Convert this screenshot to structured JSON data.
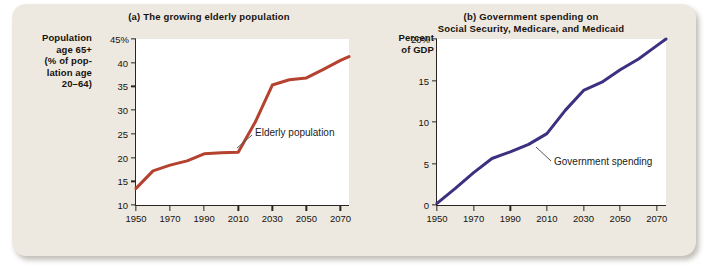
{
  "figure": {
    "background_color": "#eee9e0",
    "panels": [
      {
        "key": "a",
        "title": "(a) The growing elderly population",
        "y_axis_title": "Population\nage 65+\n(% of pop-\nlation age\n20–64)",
        "y_axis_title_lines": [
          "Population",
          "age 65+",
          "(% of pop-",
          "lation age",
          "20–64)"
        ],
        "annotation": "Elderly population",
        "line_color": "#b5412f"
      },
      {
        "key": "b",
        "title_lines": [
          "(b) Government spending on",
          "Social Security, Medicare, and Medicaid"
        ],
        "y_axis_title_lines": [
          "Percent",
          "of GDP"
        ],
        "annotation": "Government spending",
        "line_color": "#3b3180"
      }
    ]
  },
  "chart_data": [
    {
      "type": "line",
      "title": "(a) The growing elderly population",
      "xlabel": "",
      "ylabel": "Population age 65+ (% of population age 20–64)",
      "ylim": [
        10,
        45
      ],
      "xlim": [
        1950,
        2075
      ],
      "yticks": [
        10,
        15,
        20,
        25,
        30,
        35,
        40,
        45
      ],
      "ytick_labels": [
        "10",
        "15",
        "20",
        "25",
        "30",
        "35",
        "40",
        "45%"
      ],
      "xticks": [
        1950,
        1970,
        1990,
        2010,
        2030,
        2050,
        2070
      ],
      "xtick_labels": [
        "1950",
        "1970",
        "1990",
        "2010",
        "2030",
        "2050",
        "2070"
      ],
      "grid": false,
      "legend": "none",
      "series": [
        {
          "name": "Elderly population",
          "color": "#b5412f",
          "x": [
            1950,
            1960,
            1970,
            1980,
            1990,
            2000,
            2010,
            2020,
            2030,
            2040,
            2050,
            2060,
            2070,
            2075
          ],
          "values": [
            13.5,
            17.2,
            18.4,
            19.3,
            20.8,
            21.0,
            21.1,
            27.5,
            35.3,
            36.4,
            36.8,
            38.6,
            40.5,
            41.3
          ]
        }
      ],
      "annotations": [
        {
          "text": "Elderly population",
          "x": 2012,
          "y": 21.0
        }
      ]
    },
    {
      "type": "line",
      "title": "(b) Government spending on Social Security, Medicare, and Medicaid",
      "xlabel": "",
      "ylabel": "Percent of GDP",
      "ylim": [
        0,
        20
      ],
      "xlim": [
        1950,
        2075
      ],
      "yticks": [
        0,
        5,
        10,
        15,
        20
      ],
      "ytick_labels": [
        "0",
        "5",
        "10",
        "15",
        "20%"
      ],
      "xticks": [
        1950,
        1970,
        1990,
        2010,
        2030,
        2050,
        2070
      ],
      "xtick_labels": [
        "1950",
        "1970",
        "1990",
        "2010",
        "2030",
        "2050",
        "2070"
      ],
      "grid": false,
      "legend": "none",
      "series": [
        {
          "name": "Government spending",
          "color": "#3b3180",
          "x": [
            1950,
            1960,
            1970,
            1980,
            1985,
            1990,
            2000,
            2010,
            2020,
            2030,
            2040,
            2050,
            2060,
            2070,
            2075
          ],
          "values": [
            0.2,
            2.0,
            3.9,
            5.6,
            6.0,
            6.4,
            7.3,
            8.6,
            11.4,
            13.8,
            14.8,
            16.3,
            17.6,
            19.2,
            20.0
          ]
        }
      ],
      "annotations": [
        {
          "text": "Government spending",
          "x": 2012,
          "y": 8.6
        }
      ]
    }
  ]
}
